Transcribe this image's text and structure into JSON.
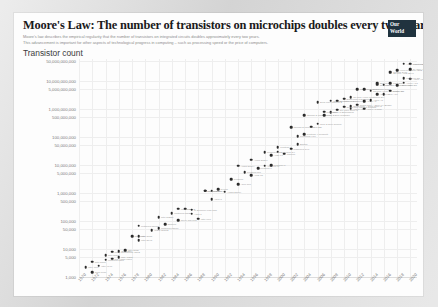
{
  "header": {
    "title": "Moore's Law: The number of transistors on microchips doubles every two years",
    "subtitle_line1": "Moore's law describes the empirical regularity that the number of transistors on integrated circuits doubles approximately every two years.",
    "subtitle_line2": "This advancement is important for other aspects of technological progress in computing – such as processing speed or the price of computers.",
    "logo_line1": "Our World",
    "logo_line2": "in Data"
  },
  "chart_data": {
    "type": "scatter",
    "title": "Moore's Law: The number of transistors on microchips doubles every two years",
    "ylabel": "Transistor count",
    "xlabel": "",
    "grid": true,
    "legend": "none",
    "yscale": "log",
    "ylim": [
      1000,
      50000000000
    ],
    "xlim": [
      1970,
      2021
    ],
    "ytick_labels": [
      "50,000,000,000",
      "10,000,000,000",
      "5,000,000,000",
      "1,000,000,000",
      "500,000,000",
      "100,000,000",
      "50,000,000",
      "10,000,000",
      "5,000,000",
      "1,000,000",
      "500,000",
      "100,000",
      "50,000",
      "10,000",
      "5,000",
      "1,000"
    ],
    "ytick_values": [
      50000000000,
      10000000000,
      5000000000,
      1000000000,
      500000000,
      100000000,
      50000000,
      10000000,
      5000000,
      1000000,
      500000,
      100000,
      50000,
      10000,
      5000,
      1000
    ],
    "xtick_labels": [
      "1970",
      "1972",
      "1974",
      "1976",
      "1978",
      "1980",
      "1982",
      "1984",
      "1986",
      "1988",
      "1990",
      "1992",
      "1994",
      "1996",
      "1998",
      "2000",
      "2002",
      "2004",
      "2006",
      "2008",
      "2010",
      "2012",
      "2014",
      "2016",
      "2018",
      "2020"
    ],
    "xtick_values": [
      1970,
      1972,
      1974,
      1976,
      1978,
      1980,
      1982,
      1984,
      1986,
      1988,
      1990,
      1992,
      1994,
      1996,
      1998,
      2000,
      2002,
      2004,
      2006,
      2008,
      2010,
      2012,
      2014,
      2016,
      2018,
      2020
    ],
    "points": [
      {
        "x": 1971,
        "y": 2250,
        "label": "Intel 4004"
      },
      {
        "x": 1972,
        "y": 3500,
        "label": "Intel 8008"
      },
      {
        "x": 1974,
        "y": 4100,
        "label": "Motorola 6800"
      },
      {
        "x": 1974,
        "y": 6000,
        "label": "Intel 8080"
      },
      {
        "x": 1975,
        "y": 8000,
        "label": "MOS Technology 6502"
      },
      {
        "x": 1976,
        "y": 5000,
        "label": "RCA 1802"
      },
      {
        "x": 1976,
        "y": 8500,
        "label": "Zilog Z80"
      },
      {
        "x": 1978,
        "y": 29000,
        "label": "Intel 8086"
      },
      {
        "x": 1979,
        "y": 29000,
        "label": "Intel 8088"
      },
      {
        "x": 1979,
        "y": 68000,
        "label": "Motorola 68000"
      },
      {
        "x": 1982,
        "y": 134000,
        "label": "Intel 80286"
      },
      {
        "x": 1982,
        "y": 55000,
        "label": "Motorola 68010"
      },
      {
        "x": 1984,
        "y": 190000,
        "label": "Motorola 68020"
      },
      {
        "x": 1985,
        "y": 275000,
        "label": "Intel 80386"
      },
      {
        "x": 1986,
        "y": 273000,
        "label": "ARM 2"
      },
      {
        "x": 1987,
        "y": 250000,
        "label": "TI Explorer Lisp chip"
      },
      {
        "x": 1988,
        "y": 120000,
        "label": "Intel i960"
      },
      {
        "x": 1989,
        "y": 1180000,
        "label": "Intel 80486"
      },
      {
        "x": 1989,
        "y": 1200000,
        "label": "Motorola 68040"
      },
      {
        "x": 1990,
        "y": 600000,
        "label": "ARM 3"
      },
      {
        "x": 1991,
        "y": 1350000,
        "label": "R4000"
      },
      {
        "x": 1993,
        "y": 3100000,
        "label": "Pentium"
      },
      {
        "x": 1994,
        "y": 2000000,
        "label": "ARM 700"
      },
      {
        "x": 1995,
        "y": 5500000,
        "label": "Pentium Pro"
      },
      {
        "x": 1996,
        "y": 4300000,
        "label": "AMD K5"
      },
      {
        "x": 1997,
        "y": 7500000,
        "label": "Pentium II"
      },
      {
        "x": 1998,
        "y": 9300000,
        "label": "AMD K6-III"
      },
      {
        "x": 1999,
        "y": 9500000,
        "label": "Pentium III"
      },
      {
        "x": 1999,
        "y": 22000000,
        "label": "AMD K7"
      },
      {
        "x": 2000,
        "y": 42000000,
        "label": "Pentium 4"
      },
      {
        "x": 2001,
        "y": 25000000,
        "label": "Itanium"
      },
      {
        "x": 2002,
        "y": 220000000,
        "label": "Itanium 2 McKinley"
      },
      {
        "x": 2003,
        "y": 54000000,
        "label": "Barton"
      },
      {
        "x": 2004,
        "y": 592000000,
        "label": "Itanium 2 Madison 9M"
      },
      {
        "x": 2004,
        "y": 125000000,
        "label": "Pentium 4 Prescott"
      },
      {
        "x": 2006,
        "y": 291000000,
        "label": "Core 2 Duo Conroe"
      },
      {
        "x": 2006,
        "y": 1700000000,
        "label": "Dual-core Itanium 2"
      },
      {
        "x": 2007,
        "y": 582000000,
        "label": "Core 2 Duo Wolfdale"
      },
      {
        "x": 2008,
        "y": 731000000,
        "label": "Core i7 Bloomfield"
      },
      {
        "x": 2008,
        "y": 1900000000,
        "label": "Six-core Opteron 2400"
      },
      {
        "x": 2009,
        "y": 904000000,
        "label": "Six-core Core i7"
      },
      {
        "x": 2010,
        "y": 2300000000,
        "label": "Eight-core POWER7"
      },
      {
        "x": 2010,
        "y": 1170000000,
        "label": "Quad-core Itanium Tukwila"
      },
      {
        "x": 2011,
        "y": 2600000000,
        "label": "10-core Xeon Westmere-EX"
      },
      {
        "x": 2011,
        "y": 1200000000,
        "label": "Quad-core + GPU Core i7"
      },
      {
        "x": 2012,
        "y": 5000000000,
        "label": "62-core Xeon Phi"
      },
      {
        "x": 2012,
        "y": 1400000000,
        "label": "Quad-core + GPU Ivy Bridge"
      },
      {
        "x": 2013,
        "y": 5000000000,
        "label": "Xbox One main SoC"
      },
      {
        "x": 2013,
        "y": 1860000000,
        "label": "Apple A7"
      },
      {
        "x": 2014,
        "y": 4310000000,
        "label": "15-core Xeon Ivy Bridge-EX"
      },
      {
        "x": 2014,
        "y": 2000000000,
        "label": "Apple A8"
      },
      {
        "x": 2015,
        "y": 3200000000,
        "label": "Apple A9"
      },
      {
        "x": 2015,
        "y": 7100000000,
        "label": "SPARC M7"
      },
      {
        "x": 2016,
        "y": 3300000000,
        "label": "Apple A10"
      },
      {
        "x": 2016,
        "y": 7200000000,
        "label": "22-core Xeon Broadwell-E5"
      },
      {
        "x": 2017,
        "y": 4300000000,
        "label": "Apple A11"
      },
      {
        "x": 2017,
        "y": 19200000000,
        "label": "32-core AMD Epyc"
      },
      {
        "x": 2017,
        "y": 21100000000,
        "label": "Centriq 2400"
      },
      {
        "x": 2018,
        "y": 6900000000,
        "label": "Apple A12X"
      },
      {
        "x": 2018,
        "y": 23600000000,
        "label": "Xeon Platinum 9282"
      },
      {
        "x": 2019,
        "y": 8500000000,
        "label": "Apple A13"
      },
      {
        "x": 2019,
        "y": 39500000000,
        "label": "AWS Graviton2"
      },
      {
        "x": 2020,
        "y": 11800000000,
        "label": "Apple A14"
      },
      {
        "x": 2020,
        "y": 39500000000,
        "label": "Apple M1"
      },
      {
        "x": 1972,
        "y": 1500,
        "label": "TMS 1000"
      },
      {
        "x": 1973,
        "y": 2500,
        "label": "Intel 4040"
      },
      {
        "x": 1975,
        "y": 4500,
        "label": "RCA CDP 1801"
      },
      {
        "x": 1977,
        "y": 9000,
        "label": "Intel 8085"
      },
      {
        "x": 1979,
        "y": 20000,
        "label": "Intel 8048"
      },
      {
        "x": 1981,
        "y": 46000,
        "label": "WDC 65C02"
      },
      {
        "x": 1983,
        "y": 75000,
        "label": "Z80000"
      },
      {
        "x": 1985,
        "y": 105000,
        "label": "Novix NC4016"
      },
      {
        "x": 1987,
        "y": 180000,
        "label": "ARM 1"
      },
      {
        "x": 1990,
        "y": 1200000,
        "label": "ARM 6"
      },
      {
        "x": 1992,
        "y": 1100000,
        "label": "Alpha 21064"
      },
      {
        "x": 1994,
        "y": 9300000,
        "label": "Alpha 21164"
      },
      {
        "x": 1996,
        "y": 15000000,
        "label": "Alpha 21264"
      },
      {
        "x": 1998,
        "y": 28000000,
        "label": "PowerPC G3"
      },
      {
        "x": 2000,
        "y": 29000000,
        "label": "PowerPC G4"
      },
      {
        "x": 2002,
        "y": 37500000,
        "label": "PowerPC G4e"
      },
      {
        "x": 2003,
        "y": 106000000,
        "label": "PowerPC 970"
      },
      {
        "x": 2005,
        "y": 230000000,
        "label": "Cell BE"
      },
      {
        "x": 2007,
        "y": 789000000,
        "label": "POWER6"
      },
      {
        "x": 2009,
        "y": 1950000000,
        "label": "Six-core Xeon 7400"
      },
      {
        "x": 2011,
        "y": 1000000000,
        "label": "Apple A5"
      },
      {
        "x": 2013,
        "y": 1000000000,
        "label": "Apple A7 dual"
      },
      {
        "x": 2015,
        "y": 8000000000,
        "label": "IBM z13"
      },
      {
        "x": 2017,
        "y": 8000000000,
        "label": "POWER9"
      },
      {
        "x": 2019,
        "y": 12000000000,
        "label": "Kirin 990 5G"
      },
      {
        "x": 2020,
        "y": 26000000000,
        "label": "GA100 Ampere"
      }
    ]
  }
}
